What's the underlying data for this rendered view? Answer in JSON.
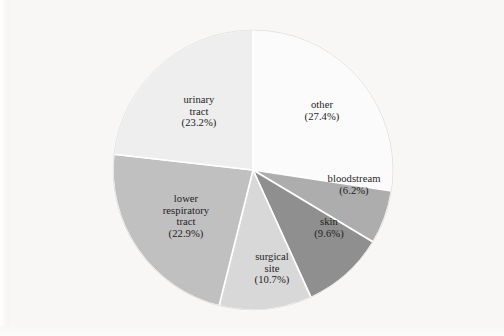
{
  "figure": {
    "caption_remnant": "",
    "background_color": "#f8f7f5"
  },
  "chart_data": {
    "type": "pie",
    "title": "",
    "subtitle": "",
    "xlabel": "",
    "ylabel": "",
    "legend_position": "none",
    "grid": false,
    "start_angle_deg": 0,
    "direction": "clockwise",
    "units": "percent",
    "total": 100.0,
    "categories": [
      "other",
      "bloodstream",
      "skin",
      "surgical site",
      "lower respiratory tract",
      "urinary tract"
    ],
    "values": [
      27.4,
      6.2,
      9.6,
      10.7,
      22.9,
      23.2
    ],
    "colors": [
      "#fbfbfb",
      "#adadad",
      "#8f8f8f",
      "#d8d8d8",
      "#c0c0c0",
      "#eeeeee"
    ],
    "slice_border_color": "#ffffff",
    "slices": [
      {
        "name": "other",
        "label_line1": "other",
        "label_line2": "(27.4%)",
        "value": 27.4,
        "color": "#fbfbfb",
        "label_x": 322,
        "label_y": 111
      },
      {
        "name": "bloodstream",
        "label_line1": "bloodstream",
        "label_line2": "(6.2%)",
        "value": 6.2,
        "color": "#adadad",
        "label_x": 354,
        "label_y": 185
      },
      {
        "name": "skin",
        "label_line1": "skin",
        "label_line2": "(9.6%)",
        "value": 9.6,
        "color": "#8f8f8f",
        "label_x": 329,
        "label_y": 228
      },
      {
        "name": "surgical site",
        "label_line1": "surgical\nsite",
        "label_line2": "(10.7%)",
        "value": 10.7,
        "color": "#d8d8d8",
        "label_x": 272,
        "label_y": 268
      },
      {
        "name": "lower respiratory tract",
        "label_line1": "lower\nrespiratory\ntract",
        "label_line2": "(22.9%)",
        "value": 22.9,
        "color": "#c0c0c0",
        "label_x": 186,
        "label_y": 216
      },
      {
        "name": "urinary tract",
        "label_line1": "urinary\ntract",
        "label_line2": "(23.2%)",
        "value": 23.2,
        "color": "#eeeeee",
        "label_x": 199,
        "label_y": 111
      }
    ],
    "geometry": {
      "center_x": 253,
      "center_y": 170,
      "radius": 140
    }
  }
}
